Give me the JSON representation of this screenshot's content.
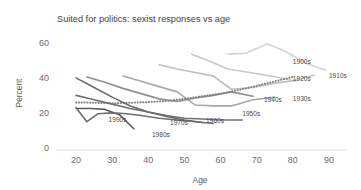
{
  "chart_data": {
    "type": "line",
    "title": "Suited for politics: sexist responses vs age",
    "xlabel": "Age",
    "ylabel": "Percent",
    "xlim": [
      15,
      95
    ],
    "ylim": [
      0,
      65
    ],
    "xticks": [
      20,
      30,
      40,
      50,
      60,
      70,
      80,
      90
    ],
    "yticks": [
      0,
      20,
      40,
      60
    ],
    "grid": false,
    "legend_position": "inline-right-of-line-ends",
    "series": [
      {
        "name": "1900s",
        "color": "#d4d4d4",
        "style": "solid",
        "label_x": 80,
        "label_y": 48,
        "x": [
          62,
          67,
          73,
          78,
          84,
          89
        ],
        "y": [
          53.5,
          54.0,
          59.5,
          55.0,
          48.0,
          44.5
        ]
      },
      {
        "name": "1910s",
        "color": "#c8c8c8",
        "style": "solid",
        "label_x": 90,
        "label_y": 40,
        "x": [
          52,
          57,
          62,
          68,
          74,
          80,
          86
        ],
        "y": [
          53.5,
          49.5,
          45.0,
          43.0,
          41.0,
          38.5,
          41.5
        ]
      },
      {
        "name": "1920s",
        "color": "#bdbdbd",
        "style": "solid",
        "label_x": 80,
        "label_y": 38,
        "x": [
          43,
          48,
          53,
          58,
          63,
          69,
          75,
          81
        ],
        "y": [
          47.5,
          45.0,
          43.0,
          41.0,
          33.5,
          34.5,
          37.0,
          38.5
        ]
      },
      {
        "name": "1930s",
        "color": "#a8a8a8",
        "style": "solid",
        "label_x": 80,
        "label_y": 27,
        "x": [
          33,
          38,
          43,
          48,
          53,
          58,
          63,
          69,
          75
        ],
        "y": [
          41.0,
          38.0,
          35.0,
          32.0,
          24.5,
          24.0,
          24.0,
          27.5,
          29.0
        ]
      },
      {
        "name": "1940s",
        "color": "#8f8f8f",
        "style": "solid",
        "label_x": 72,
        "label_y": 26,
        "x": [
          23,
          28,
          33,
          38,
          43,
          48,
          53,
          58,
          63,
          69
        ],
        "y": [
          40.5,
          37.5,
          34.0,
          31.0,
          28.0,
          26.5,
          28.5,
          30.0,
          32.0,
          29.5
        ]
      },
      {
        "name": "1950s",
        "color": "#808080",
        "style": "dotted",
        "label_x": 66,
        "label_y": 18,
        "x": [
          20,
          25,
          30,
          35,
          40,
          45,
          50,
          55,
          60,
          65,
          70,
          75,
          80
        ],
        "y": [
          26.0,
          25.8,
          25.5,
          25.8,
          26.2,
          26.8,
          28.0,
          29.5,
          31.0,
          33.0,
          35.5,
          38.0,
          40.5
        ]
      },
      {
        "name": "1960s",
        "color": "#717171",
        "style": "solid",
        "label_x": 56,
        "label_y": 14,
        "x": [
          20,
          25,
          30,
          35,
          40,
          45,
          50,
          55,
          60,
          66
        ],
        "y": [
          30.0,
          27.5,
          25.0,
          22.5,
          20.5,
          18.5,
          17.0,
          16.5,
          16.0,
          16.0
        ]
      },
      {
        "name": "1970s",
        "color": "#6a6a6a",
        "style": "solid",
        "label_x": 46,
        "label_y": 13,
        "x": [
          20,
          25,
          30,
          35,
          40,
          45,
          50,
          55
        ],
        "y": [
          40.0,
          34.5,
          29.0,
          24.0,
          20.5,
          18.0,
          16.0,
          14.5
        ]
      },
      {
        "name": "1980s",
        "color": "#5d5d5d",
        "style": "solid",
        "label_x": 41,
        "label_y": 6,
        "x": [
          20,
          24,
          28,
          32,
          36
        ],
        "y": [
          22.5,
          22.5,
          22.0,
          19.0,
          11.0
        ]
      },
      {
        "name": "1990s",
        "color": "#6e6e6e",
        "style": "solid",
        "label_x": 29,
        "label_y": 15,
        "x": [
          20,
          23,
          26,
          30,
          34,
          38,
          43,
          48,
          53,
          58
        ],
        "y": [
          23.0,
          15.0,
          19.5,
          20.0,
          19.5,
          18.5,
          17.0,
          16.0,
          15.0,
          14.0
        ]
      }
    ]
  }
}
